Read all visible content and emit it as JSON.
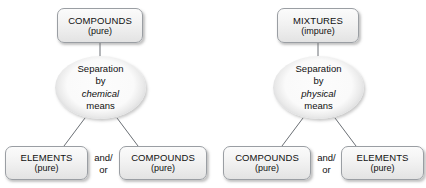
{
  "diagram": {
    "colors": {
      "box_border": "#9a9ea3",
      "box_fill_top": "#fbfbfb",
      "box_fill_bottom": "#e3e3e3",
      "ellipse_rim": "#b4b7bb",
      "connector": "#6b6f75",
      "text": "#101010",
      "background": "#ffffff"
    },
    "flows": [
      {
        "id": "chemical-flow",
        "top": {
          "title": "COMPOUNDS",
          "sub": "(pure)"
        },
        "process": {
          "line1": "Separation",
          "line2": "by",
          "line3_italic": "chemical",
          "line4": "means"
        },
        "connector_label": {
          "line1": "and/",
          "line2": "or"
        },
        "outputs": [
          {
            "title": "ELEMENTS",
            "sub": "(pure)"
          },
          {
            "title": "COMPOUNDS",
            "sub": "(pure)"
          }
        ]
      },
      {
        "id": "physical-flow",
        "top": {
          "title": "MIXTURES",
          "sub": "(impure)"
        },
        "process": {
          "line1": "Separation",
          "line2": "by",
          "line3_italic": "physical",
          "line4": "means"
        },
        "connector_label": {
          "line1": "and/",
          "line2": "or"
        },
        "outputs": [
          {
            "title": "COMPOUNDS",
            "sub": "(pure)"
          },
          {
            "title": "ELEMENTS",
            "sub": "(pure)"
          }
        ]
      }
    ]
  }
}
